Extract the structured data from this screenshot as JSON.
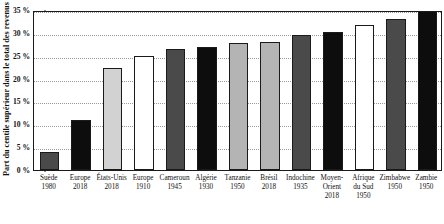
{
  "chart_data": {
    "type": "bar",
    "title": "",
    "xlabel": "",
    "ylabel": "Part du centile supérieur dans le total des revenus",
    "ylim": [
      0,
      35
    ],
    "ytick_labels": [
      "0 %",
      "5 %",
      "10 %",
      "15 %",
      "20 %",
      "25 %",
      "30 %",
      "35 %"
    ],
    "ytick_values": [
      0,
      5,
      10,
      15,
      20,
      25,
      30,
      35
    ],
    "grid": "horizontal-dotted",
    "legend": "none",
    "categories": [
      "Suède 1980",
      "Europe 2018",
      "États-Unis 2018",
      "Europe 1910",
      "Cameroun 1945",
      "Algérie 1930",
      "Tanzanie 1950",
      "Brésil 2018",
      "Indochine 1935",
      "Moyen-Orient 2018",
      "Afrique du Sud 1950",
      "Zimbabwe 1950",
      "Zambie 1950"
    ],
    "values": [
      4.0,
      11.0,
      22.4,
      25.0,
      26.5,
      27.0,
      27.8,
      28.0,
      29.6,
      30.2,
      31.8,
      33.0,
      35.8
    ],
    "bars": [
      {
        "name": "Suède",
        "year": "1980",
        "value": 4.0,
        "fill": "#4a4a4a"
      },
      {
        "name": "Europe",
        "year": "2018",
        "value": 11.0,
        "fill": "#0d0d0d"
      },
      {
        "name": "États-Unis",
        "year": "2018",
        "value": 22.4,
        "fill": "#d2d2d2"
      },
      {
        "name": "Europe",
        "year": "1910",
        "value": 25.0,
        "fill": "#ffffff"
      },
      {
        "name": "Cameroun",
        "year": "1945",
        "value": 26.5,
        "fill": "#4a4a4a"
      },
      {
        "name": "Algérie",
        "year": "1930",
        "value": 27.0,
        "fill": "#0d0d0d"
      },
      {
        "name": "Tanzanie",
        "year": "1950",
        "value": 27.8,
        "fill": "#b4b4b4"
      },
      {
        "name": "Brésil",
        "year": "2018",
        "value": 28.0,
        "fill": "#b4b4b4"
      },
      {
        "name": "Indochine",
        "year": "1935",
        "value": 29.6,
        "fill": "#4a4a4a"
      },
      {
        "name": "Moyen-Orient",
        "year": "2018",
        "value": 30.2,
        "fill": "#0d0d0d"
      },
      {
        "name": "Afrique du Sud",
        "year": "1950",
        "value": 31.8,
        "fill": "#ffffff"
      },
      {
        "name": "Zimbabwe",
        "year": "1950",
        "value": 33.0,
        "fill": "#4a4a4a"
      },
      {
        "name": "Zambie",
        "year": "1950",
        "value": 35.8,
        "fill": "#0d0d0d"
      }
    ]
  },
  "colors": {
    "axis": "#1a1a1a",
    "grid": "#9a9a9a",
    "dark_gray": "#4a4a4a",
    "black": "#0d0d0d",
    "light_gray": "#b4b4b4",
    "white": "#ffffff"
  }
}
